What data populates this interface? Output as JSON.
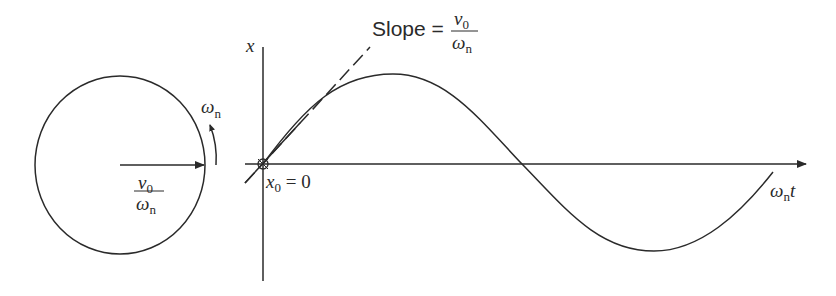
{
  "figure": {
    "circle": {
      "radius_label_num": "ν",
      "radius_label_num_sub": "0",
      "radius_label_den": "ω",
      "radius_label_den_sub": "n",
      "rotation_label": "ω",
      "rotation_label_sub": "n"
    },
    "plot": {
      "y_axis_label": "x",
      "x_axis_label": "ω",
      "x_axis_label_sub": "n",
      "x_axis_label_suffix": "t",
      "origin_label": "x",
      "origin_label_sub": "0",
      "origin_label_suffix": " = 0",
      "slope_label": "Slope = ",
      "slope_num": "ν",
      "slope_num_sub": "0",
      "slope_den": "ω",
      "slope_den_sub": "n"
    },
    "colors": {
      "line": "#2a2a2a",
      "background": "#ffffff"
    }
  }
}
